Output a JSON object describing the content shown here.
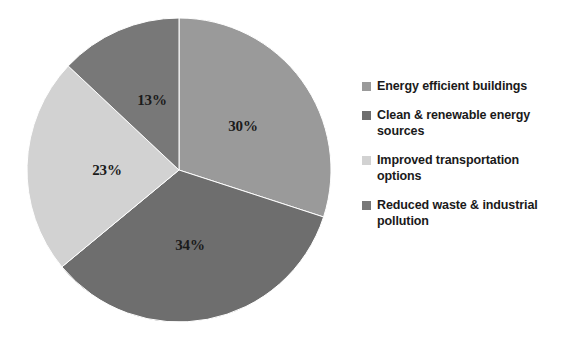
{
  "chart_data": {
    "type": "pie",
    "title": "",
    "subtitle": "",
    "xlabel": "",
    "ylabel": "",
    "grid": false,
    "legend_position": "right",
    "start_angle_deg": 0,
    "direction": "clockwise",
    "center": {
      "x": 179,
      "y": 170
    },
    "radius": 152,
    "categories": [
      "Energy efficient buildings",
      "Clean & renewable energy sources",
      "Improved transportation options",
      "Reduced waste & industrial pollution"
    ],
    "values": [
      30,
      34,
      23,
      13
    ],
    "value_unit": "%",
    "data_labels": [
      "30%",
      "34%",
      "23%",
      "13%"
    ],
    "colors": [
      "#9a9a9a",
      "#6e6e6e",
      "#d2d2d2",
      "#787878"
    ],
    "slices": [
      {
        "label": "Energy efficient buildings",
        "value": 30,
        "data_label": "30%",
        "color": "#9a9a9a",
        "start_deg": 0,
        "end_deg": 108,
        "label_x": 243,
        "label_y": 126
      },
      {
        "label": "Clean & renewable energy sources",
        "value": 34,
        "data_label": "34%",
        "color": "#6e6e6e",
        "start_deg": 108,
        "end_deg": 230.4,
        "label_x": 190,
        "label_y": 245
      },
      {
        "label": "Improved transportation options",
        "value": 23,
        "data_label": "23%",
        "color": "#d2d2d2",
        "start_deg": 230.4,
        "end_deg": 313.2,
        "label_x": 107,
        "label_y": 170
      },
      {
        "label": "Reduced waste & industrial pollution",
        "value": 13,
        "data_label": "13%",
        "color": "#787878",
        "start_deg": 313.2,
        "end_deg": 360,
        "label_x": 152,
        "label_y": 100
      }
    ]
  },
  "legend": {
    "items": [
      {
        "label": "Energy efficient buildings",
        "color": "#9a9a9a"
      },
      {
        "label": "Clean & renewable energy sources",
        "color": "#6e6e6e"
      },
      {
        "label": "Improved transportation options",
        "color": "#d2d2d2"
      },
      {
        "label": "Reduced waste & industrial pollution",
        "color": "#787878"
      }
    ]
  }
}
